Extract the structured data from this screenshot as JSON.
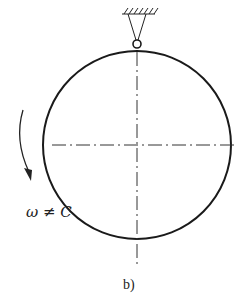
{
  "diagram": {
    "label_omega": "ω ≠ C",
    "caption": "b)",
    "elements": {
      "support": "fixed-pin-support-icon",
      "wheel": "circle",
      "centerlines": "dash-dot",
      "rotation": "curved-arrow-clockwise"
    },
    "colors": {
      "stroke": "#1a1a1a",
      "background": "#ffffff"
    }
  }
}
